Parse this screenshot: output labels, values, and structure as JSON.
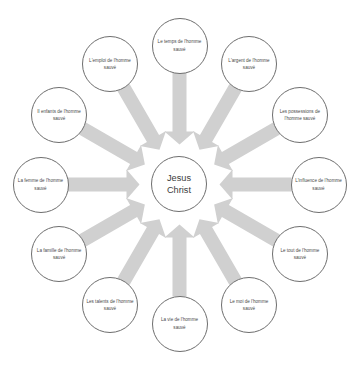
{
  "diagram": {
    "type": "radial-hub-and-spoke",
    "center": {
      "name": "jesus-christ",
      "line1": "Jesus",
      "line2": "Christ"
    },
    "arrow_color": "#d0d0d0",
    "circle_stroke": "#6e6e6e",
    "text_color": "#4a4a4a",
    "background": "#ffffff",
    "arrow_direction": "inward-toward-center",
    "satellite_count": 12,
    "satellites": [
      {
        "id": "temps",
        "label": "Le temps de l'homme sauvé",
        "angle_deg": -90
      },
      {
        "id": "argent",
        "label": "L'argent de l'homme sauvé",
        "angle_deg": -60
      },
      {
        "id": "possessions",
        "label": "Les possessions de l'homme sauvé",
        "angle_deg": -30
      },
      {
        "id": "influence",
        "label": "L'influence de l'homme sauvé",
        "angle_deg": 0
      },
      {
        "id": "tout",
        "label": "Le tout de l'homme sauvé",
        "angle_deg": 30
      },
      {
        "id": "moi",
        "label": "Le moi de l'homme sauvé",
        "angle_deg": 60
      },
      {
        "id": "vie",
        "label": "La vie de l'homme sauvé",
        "angle_deg": 90
      },
      {
        "id": "talents",
        "label": "Les talents de l'homme sauvé",
        "angle_deg": 120
      },
      {
        "id": "famille",
        "label": "La famille de l'homme sauvé",
        "angle_deg": 150
      },
      {
        "id": "femme",
        "label": "La femme de l'homme sauvé",
        "angle_deg": 180
      },
      {
        "id": "enfants",
        "label": "Il enfants de l'homme sauvé",
        "angle_deg": 210
      },
      {
        "id": "emploi",
        "label": "L'emploi de l'homme sauvé",
        "angle_deg": 240
      }
    ]
  }
}
